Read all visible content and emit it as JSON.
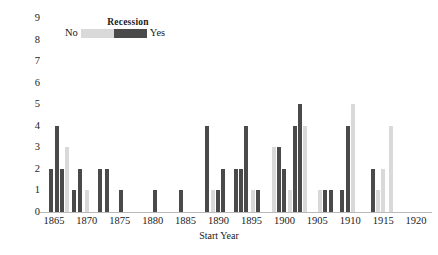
{
  "chart_data": {
    "type": "bar",
    "title": "",
    "xlabel": "Start Year",
    "ylabel": "Interventions",
    "xlim": [
      1863.5,
      1921.5
    ],
    "ylim": [
      0,
      9
    ],
    "grid": false,
    "legend": {
      "title": "Recession",
      "position": "top-left-inside",
      "entries": [
        {
          "label": "No",
          "color": "#d9d9d9"
        },
        {
          "label": "Yes",
          "color": "#4a4a4a"
        }
      ]
    },
    "y_ticks": [
      "0",
      "1",
      "2",
      "3",
      "4",
      "5",
      "6",
      "7",
      "8",
      "9"
    ],
    "x_ticks": [
      "1865",
      "1870",
      "1875",
      "1880",
      "1885",
      "1890",
      "1895",
      "1900",
      "1905",
      "1910",
      "1915",
      "1920"
    ],
    "series": [
      {
        "name": "No",
        "color": "#d9d9d9"
      },
      {
        "name": "Yes",
        "color": "#4a4a4a"
      }
    ],
    "bars": [
      {
        "x": 1864.6,
        "value": 2,
        "recession": "Yes"
      },
      {
        "x": 1865.4,
        "value": 4,
        "recession": "Yes"
      },
      {
        "x": 1866.2,
        "value": 2,
        "recession": "Yes"
      },
      {
        "x": 1867.0,
        "value": 3,
        "recession": "No"
      },
      {
        "x": 1868.0,
        "value": 1,
        "recession": "Yes"
      },
      {
        "x": 1869.0,
        "value": 2,
        "recession": "Yes"
      },
      {
        "x": 1870.0,
        "value": 1,
        "recession": "No"
      },
      {
        "x": 1872.0,
        "value": 2,
        "recession": "Yes"
      },
      {
        "x": 1873.0,
        "value": 2,
        "recession": "Yes"
      },
      {
        "x": 1875.2,
        "value": 1,
        "recession": "Yes"
      },
      {
        "x": 1880.4,
        "value": 1,
        "recession": "Yes"
      },
      {
        "x": 1884.3,
        "value": 1,
        "recession": "Yes"
      },
      {
        "x": 1888.3,
        "value": 4,
        "recession": "Yes"
      },
      {
        "x": 1889.1,
        "value": 1,
        "recession": "No"
      },
      {
        "x": 1889.9,
        "value": 1,
        "recession": "Yes"
      },
      {
        "x": 1890.7,
        "value": 2,
        "recession": "Yes"
      },
      {
        "x": 1892.6,
        "value": 2,
        "recession": "Yes"
      },
      {
        "x": 1893.4,
        "value": 2,
        "recession": "Yes"
      },
      {
        "x": 1894.2,
        "value": 4,
        "recession": "Yes"
      },
      {
        "x": 1895.2,
        "value": 1,
        "recession": "No"
      },
      {
        "x": 1896.0,
        "value": 1,
        "recession": "Yes"
      },
      {
        "x": 1898.4,
        "value": 3,
        "recession": "No"
      },
      {
        "x": 1899.2,
        "value": 3,
        "recession": "Yes"
      },
      {
        "x": 1900.0,
        "value": 2,
        "recession": "Yes"
      },
      {
        "x": 1900.8,
        "value": 1,
        "recession": "No"
      },
      {
        "x": 1901.6,
        "value": 4,
        "recession": "Yes"
      },
      {
        "x": 1902.4,
        "value": 5,
        "recession": "Yes"
      },
      {
        "x": 1903.2,
        "value": 4,
        "recession": "No"
      },
      {
        "x": 1905.4,
        "value": 1,
        "recession": "No"
      },
      {
        "x": 1906.2,
        "value": 1,
        "recession": "Yes"
      },
      {
        "x": 1907.0,
        "value": 1,
        "recession": "Yes"
      },
      {
        "x": 1908.8,
        "value": 1,
        "recession": "Yes"
      },
      {
        "x": 1909.6,
        "value": 4,
        "recession": "Yes"
      },
      {
        "x": 1910.4,
        "value": 5,
        "recession": "No"
      },
      {
        "x": 1913.4,
        "value": 2,
        "recession": "Yes"
      },
      {
        "x": 1914.2,
        "value": 1,
        "recession": "No"
      },
      {
        "x": 1915.0,
        "value": 2,
        "recession": "No"
      },
      {
        "x": 1916.2,
        "value": 4,
        "recession": "No"
      }
    ]
  }
}
